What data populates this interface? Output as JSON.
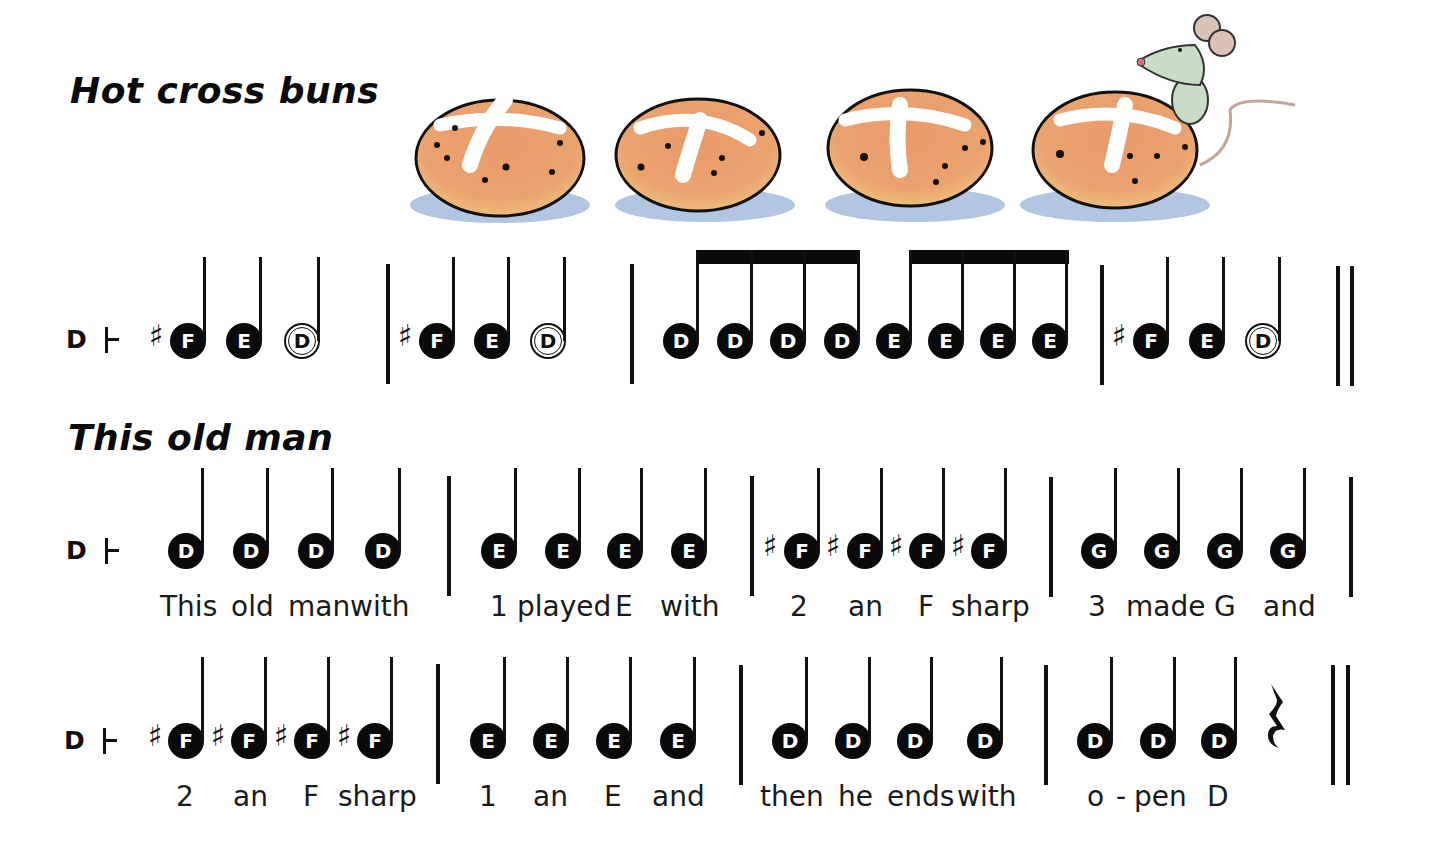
{
  "songs": [
    {
      "title": "Hot cross buns",
      "clef_label": "D",
      "lines": [
        {
          "measures": [
            {
              "notes": [
                {
                  "name": "F",
                  "sharp": true,
                  "type": "quarter"
                },
                {
                  "name": "E",
                  "type": "quarter"
                },
                {
                  "name": "D",
                  "type": "half-open"
                }
              ]
            },
            {
              "notes": [
                {
                  "name": "F",
                  "sharp": true,
                  "type": "quarter"
                },
                {
                  "name": "E",
                  "type": "quarter"
                },
                {
                  "name": "D",
                  "type": "half-open"
                }
              ]
            },
            {
              "notes": [
                {
                  "name": "D",
                  "type": "eighth"
                },
                {
                  "name": "D",
                  "type": "eighth"
                },
                {
                  "name": "D",
                  "type": "eighth"
                },
                {
                  "name": "D",
                  "type": "eighth"
                },
                {
                  "name": "E",
                  "type": "eighth"
                },
                {
                  "name": "E",
                  "type": "eighth"
                },
                {
                  "name": "E",
                  "type": "eighth"
                },
                {
                  "name": "E",
                  "type": "eighth"
                }
              ]
            },
            {
              "notes": [
                {
                  "name": "F",
                  "sharp": true,
                  "type": "quarter"
                },
                {
                  "name": "E",
                  "type": "quarter"
                },
                {
                  "name": "D",
                  "type": "half-open"
                }
              ],
              "end": "double-bar"
            }
          ]
        }
      ]
    },
    {
      "title": "This old man",
      "clef_label": "D",
      "lines": [
        {
          "measures": [
            {
              "notes": [
                "D",
                "D",
                "D",
                "D"
              ],
              "lyrics": "This  old  man with"
            },
            {
              "notes": [
                "E",
                "E",
                "E",
                "E"
              ],
              "lyrics": "1 played E   with"
            },
            {
              "notes": [
                "#F",
                "#F",
                "#F",
                "#F"
              ],
              "lyrics": "2    an    F  sharp"
            },
            {
              "notes": [
                "G",
                "G",
                "G",
                "G"
              ],
              "lyrics": "3  made  G    and"
            }
          ]
        },
        {
          "measures": [
            {
              "notes": [
                "#F",
                "#F",
                "#F",
                "#F"
              ],
              "lyrics": "2    an    F  sharp"
            },
            {
              "notes": [
                "E",
                "E",
                "E",
                "E"
              ],
              "lyrics": "1    an    E    and"
            },
            {
              "notes": [
                "D",
                "D",
                "D",
                "D"
              ],
              "lyrics": "then  he  ends with"
            },
            {
              "notes": [
                "D",
                "D",
                "D",
                "rest"
              ],
              "lyrics": "o - pen   D",
              "end": "double-bar"
            }
          ]
        }
      ]
    }
  ],
  "illustration": {
    "description": "Four hot cross buns with a mouse peeking over the last bun",
    "colors": {
      "bun": "#e9a070",
      "bun_light": "#f3cf8a",
      "cross": "#ffffff",
      "shadow": "#9fb6d8",
      "mouse": "#c9dcc6",
      "ear": "#d9c2b6"
    }
  },
  "labels": {
    "song1_title": "Hot cross buns",
    "song2_title": "This old man",
    "clef": "D",
    "sharp": "♯",
    "notes": {
      "F": "F",
      "E": "E",
      "D": "D",
      "G": "G"
    },
    "lyrics": {
      "l1m1": [
        "This",
        "old",
        "man",
        "with"
      ],
      "l1m2": [
        "1",
        "played",
        "E",
        "with"
      ],
      "l1m3": [
        "2",
        "an",
        "F",
        "sharp"
      ],
      "l1m4": [
        "3",
        "made",
        "G",
        "and"
      ],
      "l2m1": [
        "2",
        "an",
        "F",
        "sharp"
      ],
      "l2m2": [
        "1",
        "an",
        "E",
        "and"
      ],
      "l2m3": [
        "then",
        "he",
        "ends",
        "with"
      ],
      "l2m4": [
        "o",
        "-",
        "pen",
        "D"
      ]
    }
  }
}
